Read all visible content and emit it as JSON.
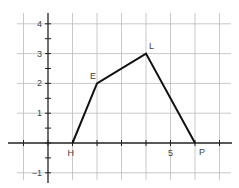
{
  "figure": {
    "type": "coordinate-plane-polygon",
    "grid": {
      "x_range": [
        -1,
        7
      ],
      "y_range": [
        -1,
        4
      ],
      "step": 1
    },
    "axes": {
      "x_tick_labels": [
        {
          "value": 5,
          "label": "5"
        }
      ],
      "y_tick_labels": [
        {
          "value": 4,
          "label": "4"
        },
        {
          "value": 3,
          "label": "3"
        },
        {
          "value": 2,
          "label": "2"
        },
        {
          "value": 1,
          "label": "1"
        },
        {
          "value": -1,
          "label": "−1"
        }
      ]
    },
    "points": [
      {
        "name": "H",
        "x": 1,
        "y": 0
      },
      {
        "name": "E",
        "x": 2,
        "y": 2
      },
      {
        "name": "L",
        "x": 4,
        "y": 3
      },
      {
        "name": "P",
        "x": 6,
        "y": 0
      }
    ],
    "polygon_order": [
      "H",
      "E",
      "L",
      "P"
    ],
    "colors": {
      "grid": "#bbbbbb",
      "axis": "#222222",
      "polygon": "#111111",
      "label": "#444444"
    }
  }
}
